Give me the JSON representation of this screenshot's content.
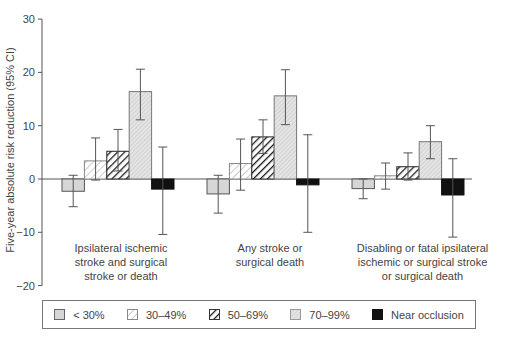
{
  "chart_data": {
    "type": "bar",
    "title": "",
    "xlabel": "",
    "ylabel": "Five-year absolute risk reduction (95% CI)",
    "ylim": [
      -20,
      30
    ],
    "yticks": [
      30,
      20,
      10,
      0,
      -10,
      -20
    ],
    "grid": false,
    "legend_position": "bottom",
    "categories": [
      "Ipsilateral ischemic\nstroke and surgical\nstroke or death",
      "Any  stroke or\nsurgical death",
      "Disabling or fatal ipsilateral\nischemic or surgical stroke\nor surgical death"
    ],
    "series": [
      {
        "name": "< 30%",
        "pattern": "light-gray",
        "values": [
          -2.3,
          -2.8,
          -1.8
        ],
        "ci_low": [
          -5.2,
          -6.4,
          -3.7
        ],
        "ci_high": [
          0.7,
          0.7,
          0.0
        ]
      },
      {
        "name": "30–49%",
        "pattern": "light-diagonal",
        "values": [
          3.4,
          2.9,
          0.6
        ],
        "ci_low": [
          -0.2,
          -2.1,
          -1.9
        ],
        "ci_high": [
          7.7,
          7.5,
          3.0
        ]
      },
      {
        "name": "50–69%",
        "pattern": "bold-diagonal",
        "values": [
          5.2,
          7.9,
          2.3
        ],
        "ci_low": [
          1.5,
          4.8,
          -0.2
        ],
        "ci_high": [
          9.3,
          11.1,
          4.9
        ]
      },
      {
        "name": "70–99%",
        "pattern": "fine-dots",
        "values": [
          16.4,
          15.6,
          7.0
        ],
        "ci_low": [
          11.1,
          10.2,
          3.8
        ],
        "ci_high": [
          20.6,
          20.5,
          10.0
        ]
      },
      {
        "name": "Near occlusion",
        "pattern": "black",
        "values": [
          -1.9,
          -1.1,
          -3.0
        ],
        "ci_low": [
          -10.4,
          -10.0,
          -10.9
        ],
        "ci_high": [
          6.0,
          8.3,
          3.8
        ]
      }
    ]
  },
  "axis": {
    "ylabel": "Five-year absolute risk reduction (95% CI)",
    "tick_labels": [
      "30",
      "20",
      "10",
      "0",
      "−10",
      "−20"
    ]
  },
  "groups": [
    {
      "label": "Ipsilateral ischemic\nstroke and surgical\nstroke or death"
    },
    {
      "label": "Any  stroke or\nsurgical death"
    },
    {
      "label": "Disabling or fatal ipsilateral\nischemic or surgical stroke\nor surgical death"
    }
  ],
  "legend": {
    "items": [
      {
        "label": "< 30%"
      },
      {
        "label": "30–49%"
      },
      {
        "label": "50–69%"
      },
      {
        "label": "70–99%"
      },
      {
        "label": "Near occlusion"
      }
    ]
  },
  "colors": {
    "axis": "#555555",
    "light_gray": "#d6d6d6",
    "hatch_light": "#9a9a9a",
    "hatch_bold": "#1a1a1a",
    "dots": "#b0b0b0",
    "black": "#111111"
  }
}
